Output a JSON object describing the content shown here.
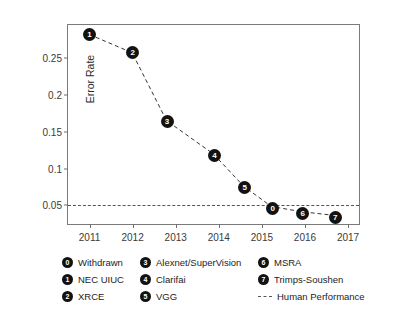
{
  "chart_data": {
    "type": "line",
    "title": "",
    "xlabel": "",
    "ylabel": "Error Rate",
    "xlim": [
      2010.5,
      2017.3
    ],
    "ylim": [
      0.022,
      0.295
    ],
    "grid": false,
    "legend_position": "below",
    "x_tick_labels": [
      "2011",
      "2012",
      "2013",
      "2014",
      "2015",
      "2016",
      "2017"
    ],
    "x_ticks": [
      2011,
      2012,
      2013,
      2014,
      2015,
      2016,
      2017
    ],
    "y_tick_labels": [
      "0.25",
      "0.2",
      "0.15",
      "0.1",
      "0.05"
    ],
    "y_ticks": [
      0.25,
      0.2,
      0.15,
      0.1,
      0.05
    ],
    "series": [
      {
        "name": "ILSVRC winning error rate",
        "linestyle": "dashed",
        "color": "#333333",
        "points": [
          {
            "id": "1",
            "label": "NEC UIUC",
            "x": 2011.0,
            "y": 0.282
          },
          {
            "id": "2",
            "label": "XRCE",
            "x": 2012.0,
            "y": 0.257
          },
          {
            "id": "3",
            "label": "Alexnet/SuperVision",
            "x": 2012.8,
            "y": 0.164
          },
          {
            "id": "4",
            "label": "Clarifai",
            "x": 2013.9,
            "y": 0.118
          },
          {
            "id": "5",
            "label": "VGG",
            "x": 2014.6,
            "y": 0.074
          },
          {
            "id": "0",
            "label": "Withdrawn",
            "x": 2015.25,
            "y": 0.046
          },
          {
            "id": "6",
            "label": "MSRA",
            "x": 2015.95,
            "y": 0.039
          },
          {
            "id": "7",
            "label": "Trimps-Soushen",
            "x": 2016.7,
            "y": 0.034
          }
        ]
      }
    ],
    "reference_lines": [
      {
        "name": "Human Performance",
        "y": 0.05,
        "linestyle": "dashed",
        "color": "#555555"
      }
    ]
  },
  "legend": {
    "col1": [
      {
        "marker": "0",
        "label": "Withdrawn"
      },
      {
        "marker": "1",
        "label": "NEC UIUC"
      },
      {
        "marker": "2",
        "label": "XRCE"
      }
    ],
    "col2": [
      {
        "marker": "3",
        "label": "Alexnet/SuperVision"
      },
      {
        "marker": "4",
        "label": "Clarifai"
      },
      {
        "marker": "5",
        "label": "VGG"
      }
    ],
    "col3": [
      {
        "marker": "6",
        "label": "MSRA"
      },
      {
        "marker": "7",
        "label": "Trimps-Soushen"
      },
      {
        "marker": "dash",
        "label": "Human Performance"
      }
    ]
  }
}
